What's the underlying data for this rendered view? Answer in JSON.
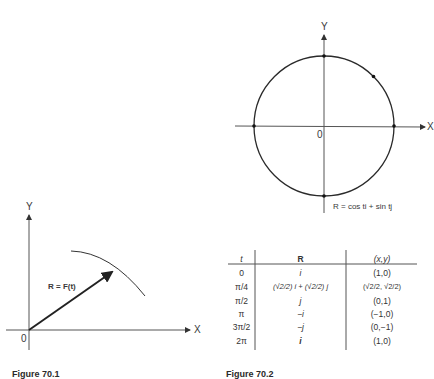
{
  "left_figure": {
    "axis_y_label": "Y",
    "axis_x_label": "X",
    "origin_label": "0",
    "vector_label": "R = F(t)",
    "caption": "Figure 70.1"
  },
  "right_figure": {
    "axis_y_label": "Y",
    "axis_x_label": "X",
    "origin_label": "0",
    "equation": "R = cos ti + sin tj",
    "caption": "Figure 70.2"
  },
  "table": {
    "headers": [
      "t",
      "R",
      "(x,y)"
    ],
    "rows": [
      {
        "t": "0",
        "R": "i",
        "xy": "(1,0)"
      },
      {
        "t": "π/4",
        "R": "(√2/2) i + (√2/2) j",
        "xy": "(√2/2, √2/2)"
      },
      {
        "t": "π/2",
        "R": "j",
        "xy": "(0,1)"
      },
      {
        "t": "π",
        "R": "−i",
        "xy": "(−1,0)"
      },
      {
        "t": "3π/2",
        "R": "−j",
        "xy": "(0,−1)"
      },
      {
        "t": "2π",
        "R": "i",
        "xy": "(1,0)"
      }
    ]
  },
  "colors": {
    "ink": "#2a2a2a",
    "axis": "#555555",
    "background": "#ffffff"
  }
}
